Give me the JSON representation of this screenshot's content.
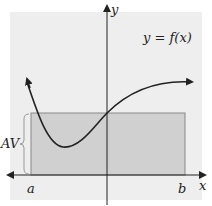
{
  "diagram": {
    "function_label": "y = f(x)",
    "y_axis_label": "y",
    "x_axis_label": "x",
    "left_bound_label": "a",
    "right_bound_label": "b",
    "average_value_label": "AV",
    "colors": {
      "background_panel": "#eeeeee",
      "rectangle_fill": "#d0d0d0",
      "rectangle_stroke": "#888888",
      "curve": "#222222",
      "axes": "#222222"
    }
  }
}
